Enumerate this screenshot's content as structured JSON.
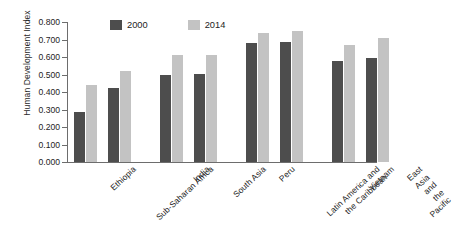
{
  "chart_data": {
    "type": "bar",
    "title": "",
    "xlabel": "",
    "ylabel": "Human Development Index",
    "ylim": [
      0.0,
      0.8
    ],
    "ytick_step": 0.1,
    "grid": false,
    "legend_position": "top-left-inside",
    "categories": [
      "Ethiopia",
      "Sub-Saharan Africa",
      "India",
      "South Asia",
      "Peru",
      "Latin America and\nthe Caribbean",
      "Vietnam",
      "East Asia and\nthe Pacific"
    ],
    "ytick_labels": [
      "0.000",
      "0.100",
      "0.200",
      "0.300",
      "0.400",
      "0.500",
      "0.600",
      "0.700",
      "0.800"
    ],
    "series": [
      {
        "name": "2000",
        "color": "#4d4d4d",
        "values": [
          0.285,
          0.425,
          0.5,
          0.505,
          0.68,
          0.685,
          0.575,
          0.595
        ]
      },
      {
        "name": "2014",
        "color": "#c3c3c3",
        "values": [
          0.44,
          0.52,
          0.61,
          0.61,
          0.74,
          0.75,
          0.67,
          0.71
        ]
      }
    ]
  },
  "legend": {
    "items": [
      {
        "label": "2000"
      },
      {
        "label": "2014"
      }
    ]
  },
  "axis": {
    "y_title": "Human Development Index"
  }
}
